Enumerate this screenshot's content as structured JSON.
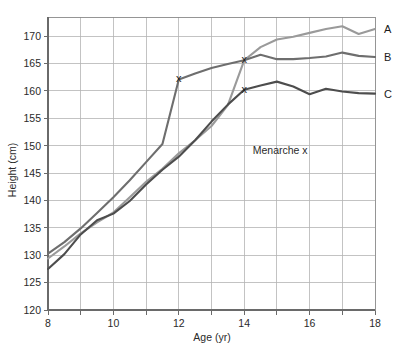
{
  "chart_data": {
    "type": "line",
    "title": "",
    "xlabel": "Age (yr)",
    "ylabel": "Height (cm)",
    "xlim": [
      8,
      18
    ],
    "ylim": [
      120,
      173.5
    ],
    "x_ticks": [
      8,
      9,
      10,
      11,
      12,
      13,
      14,
      15,
      16,
      17,
      18
    ],
    "x_tick_labels": [
      "8",
      "",
      "10",
      "",
      "12",
      "",
      "14",
      "",
      "16",
      "",
      "18"
    ],
    "y_ticks": [
      120,
      125,
      130,
      135,
      140,
      145,
      150,
      155,
      160,
      165,
      170
    ],
    "y_tick_labels": [
      "120",
      "125",
      "130",
      "135",
      "140",
      "145",
      "150",
      "155",
      "160",
      "165",
      "170"
    ],
    "grid": true,
    "legend_position": "right-inline",
    "annotations": [
      {
        "name": "menarche-note",
        "text": "Menarche x",
        "x": 15.1,
        "y": 148.5
      }
    ],
    "markers": [
      {
        "name": "menarche-marker-b",
        "series": "B",
        "glyph": "x",
        "x": 12.0,
        "y": 162.1
      },
      {
        "name": "menarche-marker-a",
        "series": "A",
        "glyph": "x",
        "x": 14.0,
        "y": 165.6
      },
      {
        "name": "menarche-marker-c",
        "series": "C",
        "glyph": "x",
        "x": 14.0,
        "y": 160.2
      }
    ],
    "x": [
      8,
      8.5,
      9,
      9.5,
      10,
      10.5,
      11,
      11.5,
      12,
      12.5,
      13,
      13.5,
      14,
      14.5,
      15,
      15.5,
      16,
      16.5,
      17,
      17.5,
      18
    ],
    "series": [
      {
        "name": "A",
        "label": "A",
        "color": "#9a9a9a",
        "values": [
          129.4,
          131.6,
          134.0,
          136.0,
          137.8,
          140.6,
          143.4,
          145.8,
          148.6,
          151.0,
          153.6,
          157.4,
          165.6,
          168.0,
          169.4,
          169.9,
          170.6,
          171.3,
          171.8,
          170.4,
          171.3
        ]
      },
      {
        "name": "B",
        "label": "B",
        "color": "#6e6e6e",
        "values": [
          130.3,
          132.4,
          134.9,
          137.7,
          140.6,
          143.7,
          147.0,
          150.3,
          162.1,
          163.2,
          164.2,
          164.9,
          165.6,
          166.6,
          165.8,
          165.8,
          166.0,
          166.3,
          167.0,
          166.4,
          166.2
        ]
      },
      {
        "name": "C",
        "label": "C",
        "color": "#4d4d4d",
        "values": [
          127.5,
          130.2,
          133.8,
          136.4,
          137.6,
          139.9,
          142.9,
          145.6,
          148.0,
          151.0,
          154.4,
          157.5,
          160.2,
          161.0,
          161.7,
          160.8,
          159.4,
          160.4,
          159.9,
          159.6,
          159.5
        ]
      }
    ]
  },
  "series_labels": {
    "a": "A",
    "b": "B",
    "c": "C"
  },
  "axes": {
    "x_title": "Age (yr)",
    "y_title": "Height (cm)"
  }
}
